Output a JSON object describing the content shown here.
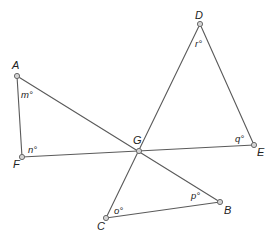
{
  "diagram": {
    "type": "geometry",
    "line_color": "#5a5a5a",
    "point_fill": "#d4d4d4",
    "points": {
      "A": {
        "label": "A",
        "x": 17,
        "y": 76
      },
      "D": {
        "label": "D",
        "x": 200,
        "y": 24
      },
      "G": {
        "label": "G",
        "x": 139,
        "y": 151
      },
      "E": {
        "label": "E",
        "x": 254,
        "y": 145
      },
      "F": {
        "label": "F",
        "x": 22,
        "y": 157
      },
      "C": {
        "label": "C",
        "x": 106,
        "y": 218
      },
      "B": {
        "label": "B",
        "x": 220,
        "y": 202
      }
    },
    "segments": [
      {
        "from": "A",
        "to": "B"
      },
      {
        "from": "A",
        "to": "F"
      },
      {
        "from": "F",
        "to": "E"
      },
      {
        "from": "D",
        "to": "C"
      },
      {
        "from": "D",
        "to": "E"
      },
      {
        "from": "C",
        "to": "B"
      }
    ],
    "angles": {
      "m": {
        "label": "m°",
        "vertex": "A"
      },
      "n": {
        "label": "n°",
        "vertex": "F"
      },
      "r": {
        "label": "r°",
        "vertex": "D"
      },
      "q": {
        "label": "q°",
        "vertex": "E"
      },
      "o": {
        "label": "o°",
        "vertex": "C"
      },
      "p": {
        "label": "p°",
        "vertex": "B"
      }
    }
  }
}
